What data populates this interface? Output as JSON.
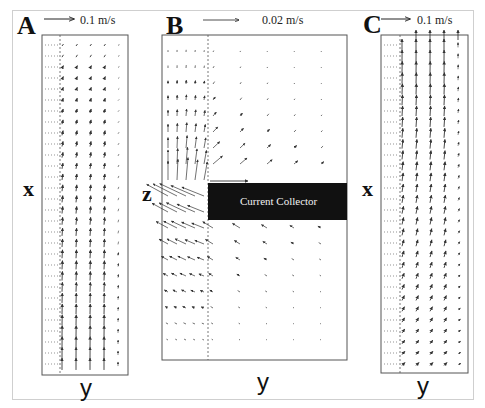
{
  "figure": {
    "panels": [
      {
        "id": "A",
        "letter": "A",
        "scale_label": "0.1 m/s",
        "vertical_axis": "x",
        "horizontal_axis": "y"
      },
      {
        "id": "B",
        "letter": "B",
        "scale_label": "0.02 m/s",
        "vertical_axis": "z",
        "horizontal_axis": "y",
        "block_label": "Current Collector"
      },
      {
        "id": "C",
        "letter": "C",
        "scale_label": "0.1 m/s",
        "vertical_axis": "x",
        "horizontal_axis": "y"
      }
    ],
    "colors": {
      "arrow": "#333333",
      "frame": "#555555",
      "collector_fill": "#111111",
      "collector_text": "#f2f2f2"
    }
  }
}
